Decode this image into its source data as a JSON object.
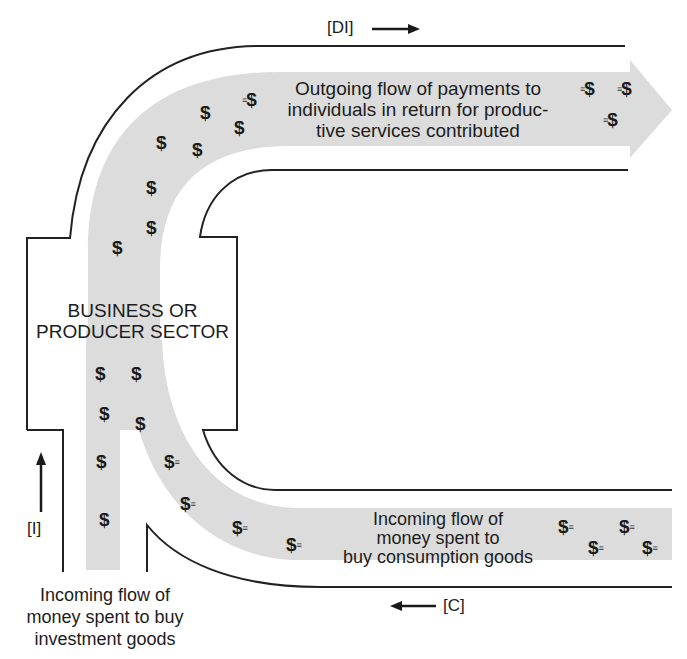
{
  "diagram": {
    "colors": {
      "background": "#ffffff",
      "pipe_outline": "#222222",
      "flow_band": "#dcdcdc",
      "text": "#1c1c1c"
    },
    "sector_box": {
      "label_line1": "BUSINESS OR",
      "label_line2": "PRODUCER SECTOR"
    },
    "outgoing_flow": {
      "tag": "[DI]",
      "tag_arrow": "→",
      "line1": "Outgoing flow of payments to",
      "line2": "individuals in return for produc-",
      "line3": "tive services contributed"
    },
    "consumption_flow": {
      "tag": "[C]",
      "tag_arrow": "←",
      "line1": "Incoming flow of",
      "line2": "money spent to",
      "line3": "buy consumption goods"
    },
    "investment_flow": {
      "tag": "[I]",
      "tag_arrow": "↑",
      "line1": "Incoming flow of",
      "line2": "money spent to buy",
      "line3": "investment goods"
    },
    "money_symbol": "$",
    "speed_trail": "≡"
  }
}
